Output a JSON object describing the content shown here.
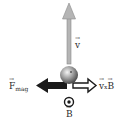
{
  "diagram": {
    "labels": {
      "velocity": "v",
      "force": "F",
      "force_sub": "mag",
      "cross_v": "v",
      "cross_op": "x",
      "cross_b": "B",
      "field": "B"
    },
    "charge_sign": "-",
    "colors": {
      "velocity_arrow": "#a9a9a9",
      "force_arrow": "#1a1a1a",
      "cross_arrow_outline": "#1a1a1a",
      "sphere": "#8a8a8a",
      "text": "#2a2a2a"
    }
  }
}
